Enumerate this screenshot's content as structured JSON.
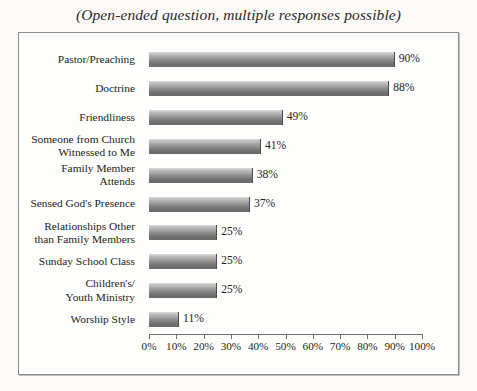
{
  "chart_data": {
    "type": "bar",
    "title": "(Open-ended question, multiple responses possible)",
    "orientation": "horizontal",
    "xlabel": "",
    "ylabel": "",
    "xlim": [
      0,
      100
    ],
    "grid": false,
    "legend": null,
    "axis_unit": "%",
    "categories": [
      "Pastor/Preaching",
      "Doctrine",
      "Friendliness",
      "Someone from Church Witnessed to Me",
      "Family Member Attends",
      "Sensed God's Presence",
      "Relationships Other than Family Members",
      "Sunday School Class",
      "Children's/ Youth Ministry",
      "Worship Style"
    ],
    "values": [
      90,
      88,
      49,
      41,
      38,
      37,
      25,
      25,
      25,
      11
    ],
    "value_labels": [
      "90%",
      "88%",
      "49%",
      "41%",
      "38%",
      "37%",
      "25%",
      "25%",
      "25%",
      "11%"
    ],
    "xticks": [
      0,
      10,
      20,
      30,
      40,
      50,
      60,
      70,
      80,
      90,
      100
    ],
    "xtick_labels": [
      "0%",
      "10%",
      "20%",
      "30%",
      "40%",
      "50%",
      "60%",
      "70%",
      "80%",
      "90%",
      "100%"
    ],
    "bar_color_light": "#d8d8d8",
    "bar_color_dark": "#6b6b6b",
    "frame_color": "#8c8c8c",
    "text_color": "#232323"
  },
  "rows": [
    {
      "label_lines": [
        "Pastor/Preaching"
      ],
      "value_label": "90%"
    },
    {
      "label_lines": [
        "Doctrine"
      ],
      "value_label": "88%"
    },
    {
      "label_lines": [
        "Friendliness"
      ],
      "value_label": "49%"
    },
    {
      "label_lines": [
        "Someone from Church",
        "Witnessed to Me"
      ],
      "value_label": "41%"
    },
    {
      "label_lines": [
        "Family Member",
        "Attends"
      ],
      "value_label": "38%"
    },
    {
      "label_lines": [
        "Sensed God's Presence"
      ],
      "value_label": "37%"
    },
    {
      "label_lines": [
        "Relationships Other",
        "than Family Members"
      ],
      "value_label": "25%"
    },
    {
      "label_lines": [
        "Sunday School Class"
      ],
      "value_label": "25%"
    },
    {
      "label_lines": [
        "Children's/",
        "Youth Ministry"
      ],
      "value_label": "25%"
    },
    {
      "label_lines": [
        "Worship Style"
      ],
      "value_label": "11%"
    }
  ]
}
